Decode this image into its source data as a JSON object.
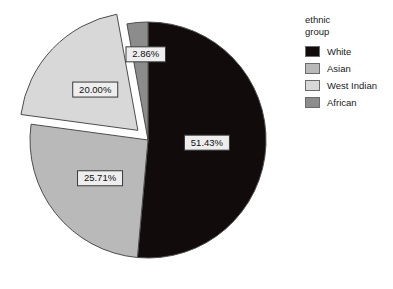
{
  "chart_data": {
    "type": "pie",
    "title": "",
    "legend_title": "ethnic\ngroup",
    "legend_position": "right",
    "grid": false,
    "start_angle_deg": 0,
    "direction": "clockwise",
    "categories": [
      "White",
      "Asian",
      "West Indian",
      "African"
    ],
    "values": [
      51.43,
      25.71,
      20.0,
      2.86
    ],
    "value_unit": "%",
    "labels": [
      "51.43%",
      "25.71%",
      "20.00%",
      "2.86%"
    ],
    "colors": [
      "#120b0c",
      "#b9b9b9",
      "#d8d8d8",
      "#8c8c8c"
    ],
    "exploded": [
      false,
      false,
      true,
      false
    ],
    "slices": [
      {
        "name": "White",
        "value": 51.43,
        "label": "51.43%",
        "color": "#120b0c",
        "exploded": false
      },
      {
        "name": "Asian",
        "value": 25.71,
        "label": "25.71%",
        "color": "#b9b9b9",
        "exploded": false
      },
      {
        "name": "West Indian",
        "value": 20.0,
        "label": "20.00%",
        "color": "#d8d8d8",
        "exploded": true
      },
      {
        "name": "African",
        "value": 2.86,
        "label": "2.86%",
        "color": "#8c8c8c",
        "exploded": false
      }
    ]
  },
  "legend": {
    "title": "ethnic\ngroup",
    "items": [
      {
        "label": "White",
        "color": "#120b0c"
      },
      {
        "label": "Asian",
        "color": "#b9b9b9"
      },
      {
        "label": "West Indian",
        "color": "#d8d8d8"
      },
      {
        "label": "African",
        "color": "#8c8c8c"
      }
    ]
  },
  "geometry": {
    "cx": 148,
    "cy": 140,
    "r": 118,
    "explode_offset": 14
  }
}
